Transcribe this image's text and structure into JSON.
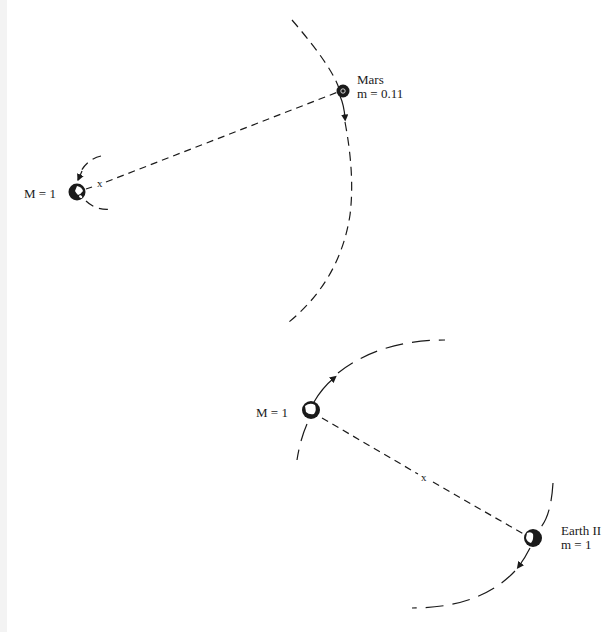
{
  "colors": {
    "ink": "#1a1a1a",
    "background": "#ffffff",
    "edge_strip": "#f3f3f3"
  },
  "system_1": {
    "primary": {
      "label": "M = 1",
      "icon": "earth-globe-icon"
    },
    "secondary": {
      "name": "Mars",
      "mass_label": "m = 0.11",
      "icon": "mars-globe-icon"
    },
    "center_of_mass_marker": "x"
  },
  "system_2": {
    "primary": {
      "label": "M = 1",
      "icon": "earth-globe-icon"
    },
    "secondary": {
      "name": "Earth II",
      "mass_label": "m = 1",
      "icon": "earth-globe-icon"
    },
    "center_of_mass_marker": "x"
  }
}
